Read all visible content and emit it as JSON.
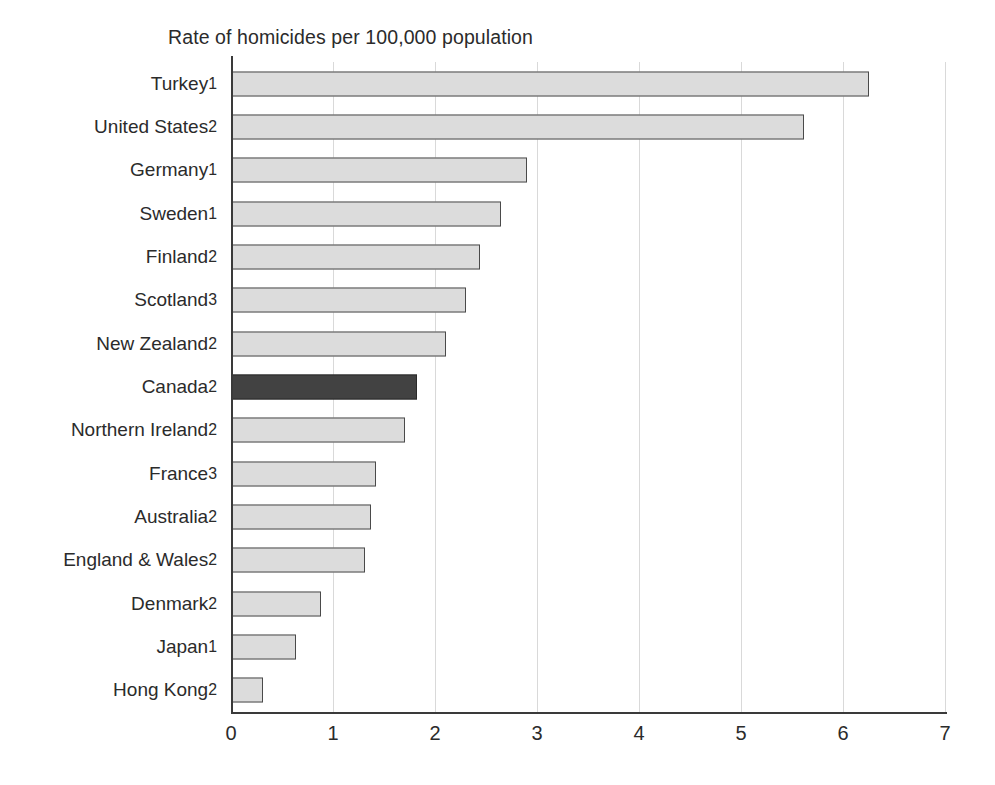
{
  "chart_data": {
    "type": "bar",
    "orientation": "horizontal",
    "title": "Rate of homicides per 100,000 population",
    "xlabel": "",
    "ylabel": "",
    "xlim": [
      0,
      7
    ],
    "xticks": [
      "0",
      "1",
      "2",
      "3",
      "4",
      "5",
      "6",
      "7"
    ],
    "grid": true,
    "legend": "none",
    "highlight_category": "Canada",
    "colors": {
      "bar_fill": "#dcdcdc",
      "bar_border": "#4a4a4a",
      "highlight_fill": "#424242",
      "highlight_border": "#2a2a2a",
      "gridline": "#d9d9d9",
      "axis": "#3a3a3a",
      "text": "#2b2b2b"
    },
    "categories": [
      "Turkey",
      "United States",
      "Germany",
      "Sweden",
      "Finland",
      "Scotland",
      "New Zealand",
      "Canada",
      "Northern Ireland",
      "France",
      "Australia",
      "England & Wales",
      "Denmark",
      "Japan",
      "Hong Kong"
    ],
    "footnotes": [
      "1",
      "2",
      "1",
      "1",
      "2",
      "3",
      "2",
      "2",
      "2",
      "3",
      "2",
      "2",
      "2",
      "1",
      "2"
    ],
    "values": [
      6.25,
      5.62,
      2.9,
      2.65,
      2.44,
      2.3,
      2.11,
      1.82,
      1.71,
      1.42,
      1.37,
      1.31,
      0.88,
      0.64,
      0.31
    ],
    "bars": [
      {
        "label": "Turkey",
        "footnote": "1",
        "value": 6.25,
        "highlight": false
      },
      {
        "label": "United States",
        "footnote": "2",
        "value": 5.62,
        "highlight": false
      },
      {
        "label": "Germany",
        "footnote": "1",
        "value": 2.9,
        "highlight": false
      },
      {
        "label": "Sweden",
        "footnote": "1",
        "value": 2.65,
        "highlight": false
      },
      {
        "label": "Finland",
        "footnote": "2",
        "value": 2.44,
        "highlight": false
      },
      {
        "label": "Scotland",
        "footnote": "3",
        "value": 2.3,
        "highlight": false
      },
      {
        "label": "New Zealand",
        "footnote": "2",
        "value": 2.11,
        "highlight": false
      },
      {
        "label": "Canada",
        "footnote": "2",
        "value": 1.82,
        "highlight": true
      },
      {
        "label": "Northern Ireland",
        "footnote": "2",
        "value": 1.71,
        "highlight": false
      },
      {
        "label": "France",
        "footnote": "3",
        "value": 1.42,
        "highlight": false
      },
      {
        "label": "Australia",
        "footnote": "2",
        "value": 1.37,
        "highlight": false
      },
      {
        "label": "England & Wales",
        "footnote": "2",
        "value": 1.31,
        "highlight": false
      },
      {
        "label": "Denmark",
        "footnote": "2",
        "value": 0.88,
        "highlight": false
      },
      {
        "label": "Japan",
        "footnote": "1",
        "value": 0.64,
        "highlight": false
      },
      {
        "label": "Hong Kong",
        "footnote": "2",
        "value": 0.31,
        "highlight": false
      }
    ]
  }
}
